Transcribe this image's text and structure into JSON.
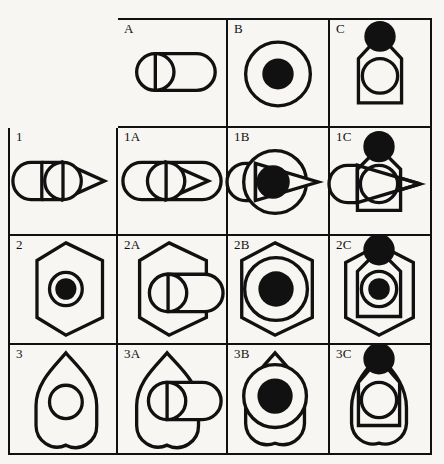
{
  "figure": {
    "type": "combination-matrix",
    "background_color": "#f7f6f2",
    "ink_color": "#111111",
    "rows": 4,
    "cols": 4,
    "description_visible_text_only": true
  },
  "corner": {
    "label": ""
  },
  "columns": [
    {
      "id": "A",
      "label": "A",
      "shape_parts": [
        "rounded-rectangle",
        "circle"
      ]
    },
    {
      "id": "B",
      "label": "B",
      "shape_parts": [
        "large-circle",
        "filled-circle"
      ]
    },
    {
      "id": "C",
      "label": "C",
      "shape_parts": [
        "pentagon-tag",
        "inner-circle",
        "filled-circle-top"
      ]
    }
  ],
  "rows": [
    {
      "id": "1",
      "label": "1",
      "shape_parts": [
        "rounded-rectangle-left",
        "triangle-right",
        "circle"
      ]
    },
    {
      "id": "2",
      "label": "2",
      "shape_parts": [
        "hexagon",
        "ring",
        "filled-dot"
      ]
    },
    {
      "id": "3",
      "label": "3",
      "shape_parts": [
        "bullet-shape",
        "circle"
      ]
    }
  ],
  "cells": [
    {
      "id": "A",
      "label": "A"
    },
    {
      "id": "B",
      "label": "B"
    },
    {
      "id": "C",
      "label": "C"
    },
    {
      "id": "1",
      "label": "1"
    },
    {
      "id": "1A",
      "label": "1A"
    },
    {
      "id": "1B",
      "label": "1B"
    },
    {
      "id": "1C",
      "label": "1C"
    },
    {
      "id": "2",
      "label": "2"
    },
    {
      "id": "2A",
      "label": "2A"
    },
    {
      "id": "2B",
      "label": "2B"
    },
    {
      "id": "2C",
      "label": "2C"
    },
    {
      "id": "3",
      "label": "3"
    },
    {
      "id": "3A",
      "label": "3A"
    },
    {
      "id": "3B",
      "label": "3B"
    },
    {
      "id": "3C",
      "label": "3C"
    }
  ]
}
